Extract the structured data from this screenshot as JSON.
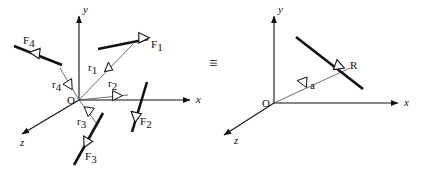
{
  "figure": {
    "title": "",
    "equivalence_symbol": "≡",
    "colors": {
      "ink": "#111111",
      "thin_line": "#4a4a4a",
      "background": "#ffffff"
    }
  },
  "left_diagram": {
    "name": "system-of-forces",
    "origin_label": "O",
    "axes": [
      {
        "id": "y",
        "label": "y",
        "direction": "up"
      },
      {
        "id": "x",
        "label": "x",
        "direction": "right"
      },
      {
        "id": "z",
        "label": "z",
        "direction": "down-left"
      }
    ],
    "force_vectors": [
      {
        "id": "F1",
        "label": "F",
        "subscript": "1",
        "description": "thick force arrow pointing up-right in upper right quadrant"
      },
      {
        "id": "F2",
        "label": "F",
        "subscript": "2",
        "description": "thick force arrow pointing down-left below the x axis"
      },
      {
        "id": "F3",
        "label": "F",
        "subscript": "3",
        "description": "thick force arrow pointing down-left in lower area"
      },
      {
        "id": "F4",
        "label": "F",
        "subscript": "4",
        "description": "thick force arrow pointing up-left in upper left quadrant"
      }
    ],
    "position_vectors": [
      {
        "id": "r1",
        "label": "r",
        "subscript": "1",
        "description": "thin position vector from O toward F1 line of action"
      },
      {
        "id": "r2",
        "label": "r",
        "subscript": "2",
        "description": "thin position vector from O toward F2 line of action"
      },
      {
        "id": "r3",
        "label": "r",
        "subscript": "3",
        "description": "thin position vector from O toward F3 line of action"
      },
      {
        "id": "r4",
        "label": "r",
        "subscript": "4",
        "description": "thin position vector from O toward F4 line of action"
      }
    ]
  },
  "right_diagram": {
    "name": "resultant-force",
    "origin_label": "O",
    "axes": [
      {
        "id": "y",
        "label": "y",
        "direction": "up"
      },
      {
        "id": "x",
        "label": "x",
        "direction": "right"
      },
      {
        "id": "z",
        "label": "z",
        "direction": "down-left"
      }
    ],
    "force_vectors": [
      {
        "id": "R",
        "label": "R",
        "subscript": "",
        "description": "thick resultant force arrow pointing down-right"
      }
    ],
    "position_vectors": [
      {
        "id": "a",
        "label": "a",
        "subscript": "",
        "description": "thin position vector from O to the line of action of R"
      }
    ]
  }
}
